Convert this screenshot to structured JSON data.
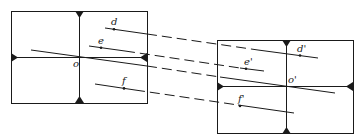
{
  "diagram": {
    "frames": [
      {
        "name": "left-frame",
        "center_label": "o"
      },
      {
        "name": "right-frame",
        "center_label": "o'"
      }
    ],
    "points": {
      "left": [
        "d",
        "e",
        "f"
      ],
      "right": [
        "d'",
        "e'",
        "f'"
      ]
    },
    "labels": {
      "d": "d",
      "e": "e",
      "f": "f",
      "o": "o",
      "d_prime": "d'",
      "e_prime": "e'",
      "f_prime": "f'",
      "o_prime": "o'"
    },
    "colors": {
      "stroke": "#1a1a1a",
      "background": "#ffffff"
    }
  }
}
